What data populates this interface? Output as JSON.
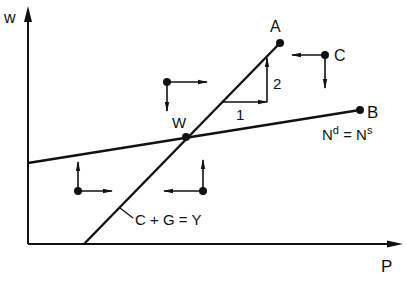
{
  "diagram": {
    "axes": {
      "y_label": "w",
      "x_label": "P"
    },
    "lines": {
      "steep": {
        "label": "C + G = Y",
        "end_label": "A"
      },
      "flat": {
        "label_main": "N",
        "label_sup_d": "d",
        "label_eq": " = N",
        "label_sup_s": "s",
        "end_label": "B"
      }
    },
    "intersection_label": "W",
    "point_c_label": "C",
    "slope_triangle": {
      "run_label": "1",
      "rise_label": "2"
    },
    "color": "#111111"
  }
}
